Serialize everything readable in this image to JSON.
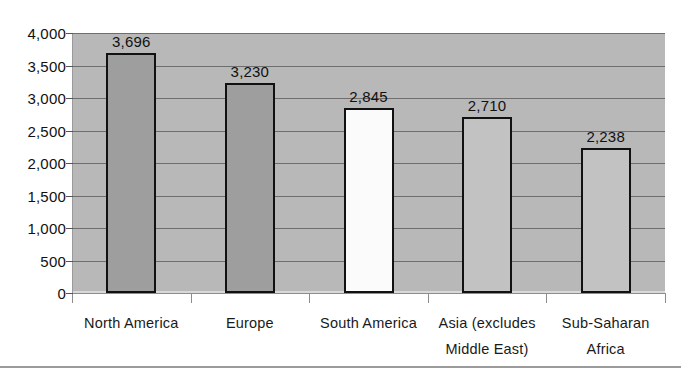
{
  "chart_data": {
    "type": "bar",
    "title": "",
    "subtitle": "",
    "xlabel": "",
    "ylabel": "",
    "categories": [
      "North America",
      "Europe",
      "South America",
      "Asia (excludes Middle East)",
      "Sub-Saharan Africa"
    ],
    "category_lines": [
      [
        "North America"
      ],
      [
        "Europe"
      ],
      [
        "South America"
      ],
      [
        "Asia (excludes",
        "Middle East)"
      ],
      [
        "Sub-Saharan",
        "Africa"
      ]
    ],
    "values": [
      3696,
      3230,
      2845,
      2710,
      2238
    ],
    "value_labels": [
      "3,696",
      "3,230",
      "2,845",
      "2,710",
      "2,238"
    ],
    "bar_colors": [
      "#9e9e9e",
      "#9e9e9e",
      "#fbfbfb",
      "#c2c2c2",
      "#c2c2c2"
    ],
    "bar_border_color": "#111111",
    "ylim": [
      0,
      4000
    ],
    "ytick_values": [
      0,
      500,
      1000,
      1500,
      2000,
      2500,
      3000,
      3500,
      4000
    ],
    "ytick_labels": [
      "0",
      "500",
      "1,000",
      "1,500",
      "2,000",
      "2,500",
      "3,000",
      "3,500",
      "4,000"
    ],
    "grid": true,
    "grid_color": "#6e6e6e",
    "plot_background": "#b8b8b8",
    "legend": null,
    "legend_position": "none",
    "annotations": []
  }
}
